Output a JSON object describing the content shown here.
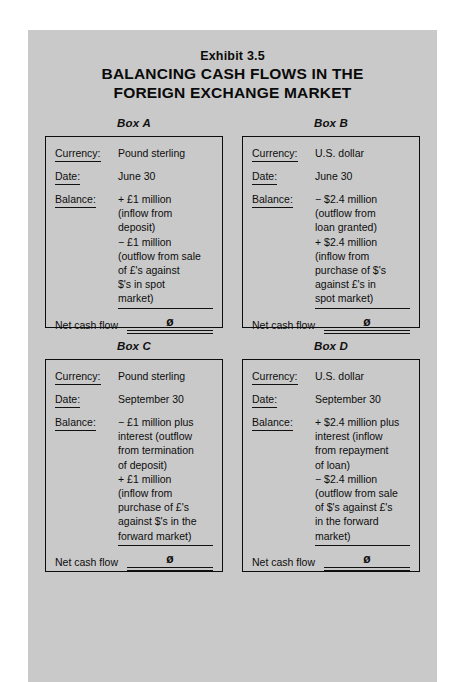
{
  "exhibit": {
    "label": "Exhibit 3.5",
    "title_line_1": "BALANCING CASH FLOWS IN THE",
    "title_line_2": "FOREIGN EXCHANGE MARKET"
  },
  "labels": {
    "currency": "Currency:",
    "date": "Date:",
    "balance": "Balance:",
    "net_cash_flow": "Net cash flow"
  },
  "colors": {
    "page_background": "#c9c9c9",
    "outer_background": "#ffffff",
    "ink": "#0d0d0d",
    "border": "#0d0d0d"
  },
  "boxes": [
    {
      "caption": "Box A",
      "currency": "Pound sterling",
      "date": "June 30",
      "balance_lines": [
        "+ £1 million",
        "(inflow from",
        "deposit)",
        "− £1 million",
        "(outflow from sale",
        "of £'s against",
        "$'s in spot",
        "market)"
      ],
      "net_cash_flow_value": "ø"
    },
    {
      "caption": "Box B",
      "currency": "U.S. dollar",
      "date": "June 30",
      "balance_lines": [
        "− $2.4 million",
        "(outflow from",
        "loan granted)",
        "+ $2.4 million",
        "(inflow from",
        "purchase of $'s",
        "against £'s in",
        "spot market)"
      ],
      "net_cash_flow_value": "ø"
    },
    {
      "caption": "Box C",
      "currency": "Pound sterling",
      "date": "September 30",
      "balance_lines": [
        "− £1 million plus",
        "interest (outflow",
        "from termination",
        "of deposit)",
        "+ £1 million",
        "(inflow from",
        "purchase of £'s",
        "against $'s in the",
        "forward market)"
      ],
      "net_cash_flow_value": "ø"
    },
    {
      "caption": "Box D",
      "currency": "U.S. dollar",
      "date": "September 30",
      "balance_lines": [
        "+ $2.4 million plus",
        "interest (inflow",
        "from repayment",
        "of loan)",
        "− $2.4 million",
        "(outflow from sale",
        "of $'s against £'s",
        "in the forward",
        "market)"
      ],
      "net_cash_flow_value": "ø"
    }
  ]
}
